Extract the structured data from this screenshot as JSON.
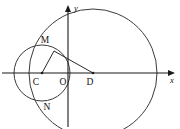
{
  "figure": {
    "width": 180,
    "height": 129,
    "background": "#ffffff",
    "stroke_color": "#3a3a3a",
    "axis_color": "#1a1a1a",
    "label_color": "#111111",
    "axes": {
      "origin_label": "O",
      "x_axis_label": "x",
      "y_axis_label": "y",
      "x_axis_y": 73,
      "y_axis_x": 68,
      "x_arrow_tip_x": 175,
      "y_arrow_tip_y": 5
    },
    "points": [
      {
        "name": "M",
        "label": "M",
        "x": 54,
        "y": 51,
        "label_x": 45,
        "label_y": 43
      },
      {
        "name": "C",
        "label": "C",
        "x": 42,
        "y": 73,
        "label_x": 36,
        "label_y": 85
      },
      {
        "name": "O",
        "label": "O",
        "x": 68,
        "y": 73,
        "label_x": 62,
        "label_y": 85
      },
      {
        "name": "D",
        "label": "D",
        "x": 93,
        "y": 73,
        "label_x": 88,
        "label_y": 85
      },
      {
        "name": "N",
        "label": "N",
        "x": 55,
        "y": 94,
        "label_x": 45,
        "label_y": 110
      }
    ],
    "circles": [
      {
        "name": "circle-C",
        "center_label": "C",
        "cx": 42,
        "cy": 73,
        "r": 28
      },
      {
        "name": "circle-D",
        "center_label": "D",
        "cx": 93,
        "cy": 73,
        "r": 64
      }
    ],
    "segments": [
      {
        "name": "segment-CM",
        "from": "C",
        "to": "M",
        "x1": 42,
        "y1": 73,
        "x2": 54,
        "y2": 51
      },
      {
        "name": "segment-MD",
        "from": "M",
        "to": "D",
        "x1": 54,
        "y1": 51,
        "x2": 93,
        "y2": 73
      }
    ]
  }
}
